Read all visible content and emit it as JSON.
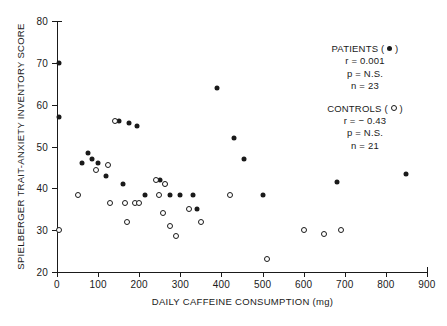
{
  "chart_data": {
    "type": "scatter",
    "title": "",
    "xlabel": "DAILY CAFFEINE CONSUMPTION (mg)",
    "ylabel": "SPIELBERGER TRAIT-ANXIETY INVENTORY SCORE",
    "xlim": [
      0,
      900
    ],
    "ylim": [
      20,
      80
    ],
    "xticks": [
      0,
      100,
      200,
      300,
      400,
      500,
      600,
      700,
      800,
      900
    ],
    "yticks": [
      20,
      30,
      40,
      50,
      60,
      70,
      80
    ],
    "grid": false,
    "legend_position": "top-right",
    "series": [
      {
        "name": "PATIENTS",
        "marker": "filled-circle",
        "color": "#1a1a1a",
        "n": 23,
        "r": "0.001",
        "p": "N.S.",
        "points": [
          [
            5,
            70
          ],
          [
            5,
            57
          ],
          [
            60,
            46
          ],
          [
            75,
            48.5
          ],
          [
            85,
            47
          ],
          [
            100,
            46
          ],
          [
            120,
            43
          ],
          [
            150,
            56
          ],
          [
            160,
            41
          ],
          [
            175,
            55.5
          ],
          [
            195,
            55
          ],
          [
            215,
            38.5
          ],
          [
            250,
            42
          ],
          [
            262,
            41
          ],
          [
            275,
            38.5
          ],
          [
            300,
            38.5
          ],
          [
            330,
            38.5
          ],
          [
            340,
            35
          ],
          [
            390,
            64
          ],
          [
            430,
            52
          ],
          [
            455,
            47
          ],
          [
            500,
            38.5
          ],
          [
            680,
            41.5
          ],
          [
            850,
            43.5
          ]
        ]
      },
      {
        "name": "CONTROLS",
        "marker": "open-circle",
        "color": "#1a1a1a",
        "n": 21,
        "r": "− 0.43",
        "p": "N.S.",
        "points": [
          [
            5,
            30
          ],
          [
            50,
            38.5
          ],
          [
            95,
            44.5
          ],
          [
            125,
            45.5
          ],
          [
            130,
            36.5
          ],
          [
            140,
            56
          ],
          [
            165,
            36.5
          ],
          [
            170,
            32
          ],
          [
            190,
            36.5
          ],
          [
            200,
            36.5
          ],
          [
            240,
            42
          ],
          [
            248,
            38.5
          ],
          [
            258,
            34
          ],
          [
            262,
            41
          ],
          [
            275,
            31
          ],
          [
            290,
            28.5
          ],
          [
            320,
            35
          ],
          [
            350,
            32
          ],
          [
            420,
            38.5
          ],
          [
            510,
            23
          ],
          [
            600,
            30
          ],
          [
            650,
            29
          ],
          [
            690,
            30
          ]
        ]
      }
    ]
  },
  "legend": {
    "patients": {
      "title": "PATIENTS",
      "glyph_open_paren": "(",
      "glyph_close_paren": ")",
      "r_line": "r = 0.001",
      "p_line": "p = N.S.",
      "n_line": "n = 23"
    },
    "controls": {
      "title": "CONTROLS",
      "glyph_open_paren": "(",
      "glyph_close_paren": ")",
      "r_line": "r = − 0.43",
      "p_line": "p = N.S.",
      "n_line": "n = 21"
    }
  }
}
